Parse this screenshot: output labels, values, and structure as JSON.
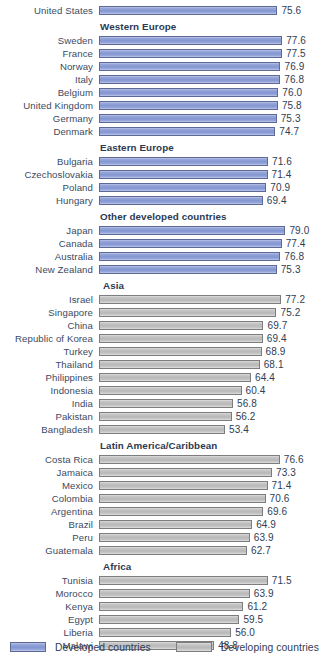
{
  "chart_data": {
    "type": "bar",
    "title": "",
    "orientation": "horizontal",
    "xlabel": "",
    "ylabel": "",
    "value_suffix": "",
    "xlim": [
      0,
      85
    ],
    "grid": false,
    "legend_position": "bottom",
    "legend": [
      {
        "key": "developed",
        "label": "Developed countries",
        "color": "#8396d2"
      },
      {
        "key": "developing",
        "label": "Developing countries",
        "color": "#b8b8b8"
      }
    ],
    "groups": [
      {
        "header": "",
        "header_indent": 0,
        "type": "developed",
        "items": [
          {
            "category": "United States",
            "value": 75.6
          }
        ]
      },
      {
        "header": "Western Europe",
        "header_indent": 100,
        "type": "developed",
        "items": [
          {
            "category": "Sweden",
            "value": 77.6
          },
          {
            "category": "France",
            "value": 77.5
          },
          {
            "category": "Norway",
            "value": 76.9
          },
          {
            "category": "Italy",
            "value": 76.8
          },
          {
            "category": "Belgium",
            "value": 76.0
          },
          {
            "category": "United Kingdom",
            "value": 75.8
          },
          {
            "category": "Germany",
            "value": 75.3
          },
          {
            "category": "Denmark",
            "value": 74.7
          }
        ]
      },
      {
        "header": "Eastern Europe",
        "header_indent": 100,
        "type": "developed",
        "items": [
          {
            "category": "Bulgaria",
            "value": 71.6
          },
          {
            "category": "Czechoslovakia",
            "value": 71.4
          },
          {
            "category": "Poland",
            "value": 70.9
          },
          {
            "category": "Hungary",
            "value": 69.4
          }
        ]
      },
      {
        "header": "Other developed countries",
        "header_indent": 100,
        "type": "developed",
        "items": [
          {
            "category": "Japan",
            "value": 79.0
          },
          {
            "category": "Canada",
            "value": 77.4
          },
          {
            "category": "Australia",
            "value": 76.8
          },
          {
            "category": "New Zealand",
            "value": 75.3
          }
        ]
      },
      {
        "header": "Asia",
        "header_indent": 103,
        "type": "developing",
        "items": [
          {
            "category": "Israel",
            "value": 77.2
          },
          {
            "category": "Singapore",
            "value": 75.2
          },
          {
            "category": "China",
            "value": 69.7
          },
          {
            "category": "Republic of Korea",
            "value": 69.4
          },
          {
            "category": "Turkey",
            "value": 68.9
          },
          {
            "category": "Thailand",
            "value": 68.1
          },
          {
            "category": "Philippines",
            "value": 64.4
          },
          {
            "category": "Indonesia",
            "value": 60.4
          },
          {
            "category": "India",
            "value": 56.8
          },
          {
            "category": "Pakistan",
            "value": 56.2
          },
          {
            "category": "Bangladesh",
            "value": 53.4
          }
        ]
      },
      {
        "header": "Latin America/Caribbean",
        "header_indent": 100,
        "type": "developing",
        "items": [
          {
            "category": "Costa Rica",
            "value": 76.6
          },
          {
            "category": "Jamaica",
            "value": 73.3
          },
          {
            "category": "Mexico",
            "value": 71.4
          },
          {
            "category": "Colombia",
            "value": 70.6
          },
          {
            "category": "Argentina",
            "value": 69.6
          },
          {
            "category": "Brazil",
            "value": 64.9
          },
          {
            "category": "Peru",
            "value": 63.9
          },
          {
            "category": "Guatemala",
            "value": 62.7
          }
        ]
      },
      {
        "header": "Africa",
        "header_indent": 103,
        "type": "developing",
        "items": [
          {
            "category": "Tunisia",
            "value": 71.5
          },
          {
            "category": "Morocco",
            "value": 63.9
          },
          {
            "category": "Kenya",
            "value": 61.2
          },
          {
            "category": "Egypt",
            "value": 59.5
          },
          {
            "category": "Liberia",
            "value": 56.0
          },
          {
            "category": "Malawi",
            "value": 48.8
          }
        ]
      }
    ]
  },
  "geometry": {
    "bar_origin_x": 96,
    "px_per_unit": 2.36,
    "value_gap_px": 4
  }
}
